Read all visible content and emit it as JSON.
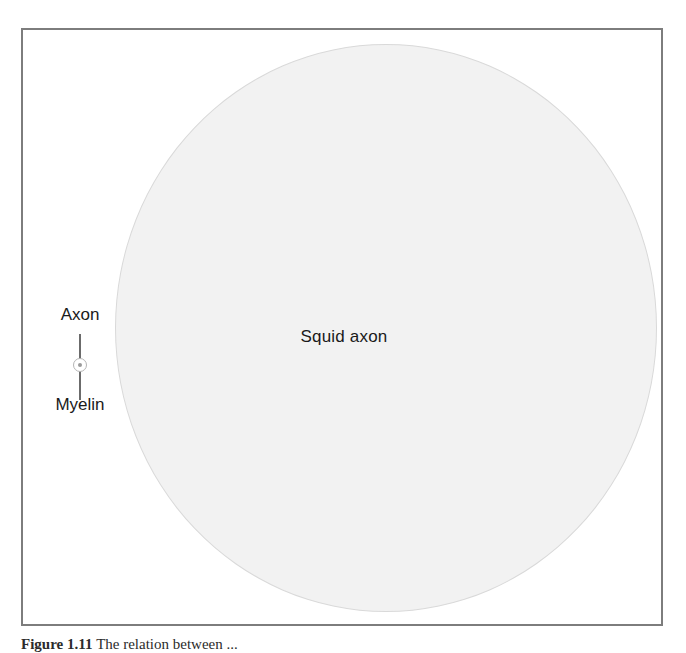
{
  "figure": {
    "background_color": "#ffffff",
    "frame": {
      "border_color": "#7d7d7d",
      "fill_color": "#ffffff"
    },
    "squid_axon": {
      "label": "Squid axon",
      "fill_color": "#f2f2f2",
      "outline_color": "#d9d9d9"
    },
    "callout": {
      "axon_label": "Axon",
      "myelin_label": "Myelin",
      "leader_line_color": "#6b6b6b",
      "sheath_color": "#b5b5b5",
      "core_color": "#9a9a9a"
    },
    "caption": {
      "number": "Figure 1.11",
      "text": "The relation between ..."
    }
  }
}
